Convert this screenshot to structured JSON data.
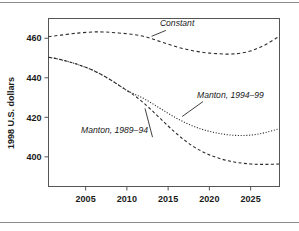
{
  "figure": {
    "background_color": "#ffffff",
    "rule_color": "#8b8b8b",
    "line_color": "#2b2b2b",
    "frame_color": "#555555"
  },
  "chart_data": {
    "type": "line",
    "title": "",
    "xlabel": "",
    "ylabel": "1998 U.S. dollars",
    "xlim": [
      2000.5,
      2028.5
    ],
    "ylim": [
      385,
      470
    ],
    "grid": false,
    "legend": "inline-annotations",
    "xticks": [
      2005,
      2010,
      2015,
      2020,
      2025
    ],
    "xtick_labels": [
      "2005",
      "2010",
      "2015",
      "2020",
      "2025"
    ],
    "yticks": [
      400,
      420,
      440,
      460
    ],
    "ytick_labels": [
      "400",
      "420",
      "440",
      "460"
    ],
    "series": [
      {
        "name": "Constant",
        "style": "dashed",
        "x": [
          2000.5,
          2002,
          2004,
          2006,
          2007,
          2008,
          2010,
          2011,
          2012,
          2013,
          2014,
          2015,
          2016,
          2017,
          2018,
          2019,
          2020,
          2021,
          2022,
          2023,
          2024,
          2025,
          2026,
          2027,
          2028,
          2028.5
        ],
        "values": [
          460.8,
          461.6,
          462.6,
          463.2,
          463.2,
          463.0,
          462.3,
          461.8,
          461.0,
          459.8,
          458.4,
          457.0,
          455.7,
          454.6,
          453.7,
          453.0,
          452.5,
          452.2,
          452.0,
          452.1,
          452.6,
          453.6,
          455.2,
          457.2,
          459.8,
          461.0
        ]
      },
      {
        "name": "Manton, 1994-99",
        "style": "dotted",
        "x": [
          2000.5,
          2002,
          2004,
          2006,
          2008,
          2009,
          2010,
          2011,
          2012,
          2013,
          2014,
          2015,
          2016,
          2017,
          2018,
          2019,
          2020,
          2021,
          2022,
          2023,
          2024,
          2025,
          2026,
          2027,
          2028,
          2028.5
        ],
        "values": [
          450.4,
          449.2,
          446.8,
          443.6,
          439.0,
          436.3,
          433.6,
          431.6,
          429.6,
          427.2,
          424.6,
          422.0,
          419.6,
          417.4,
          415.6,
          414.1,
          412.9,
          412.0,
          411.3,
          410.9,
          410.8,
          411.0,
          411.6,
          412.5,
          413.7,
          414.2
        ]
      },
      {
        "name": "Manton, 1989-94",
        "style": "dashed",
        "x": [
          2000.5,
          2002,
          2004,
          2006,
          2008,
          2009,
          2010,
          2011,
          2012,
          2013,
          2014,
          2015,
          2016,
          2017,
          2018,
          2019,
          2020,
          2021,
          2022,
          2023,
          2024,
          2025,
          2026,
          2027,
          2028,
          2028.5
        ],
        "values": [
          450.4,
          449.2,
          446.8,
          443.6,
          439.0,
          436.3,
          433.6,
          430.8,
          427.4,
          423.6,
          419.6,
          415.6,
          411.8,
          408.4,
          405.4,
          403.0,
          401.0,
          399.5,
          398.3,
          397.4,
          396.8,
          396.4,
          396.2,
          396.2,
          396.3,
          396.4
        ]
      }
    ],
    "annotations": [
      {
        "label": "Constant",
        "x": 2014.0,
        "y": 466.0,
        "anchor_x": 2013.0,
        "anchor_y": 461.0
      },
      {
        "label": "Manton, 1994–99",
        "x": 2018.5,
        "y": 430.0,
        "anchor_x": 2016.7,
        "anchor_y": 420.4
      },
      {
        "label": "Manton, 1989–94",
        "x": 2008.5,
        "y": 412.0,
        "anchor_x": 2012.2,
        "anchor_y": 424.5
      }
    ]
  }
}
